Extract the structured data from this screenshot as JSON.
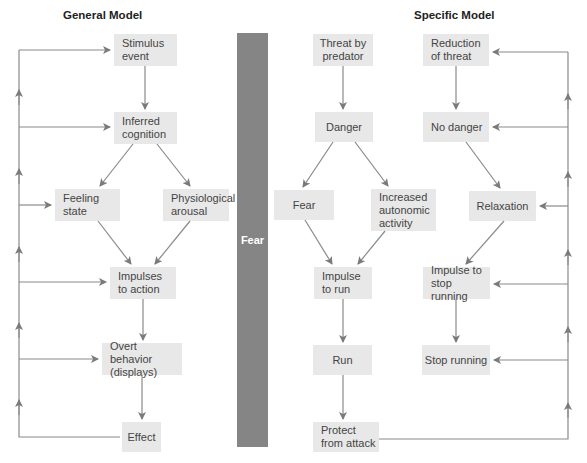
{
  "diagram": {
    "general_model": {
      "title": "General Model",
      "nodes": [
        {
          "id": "stimulus",
          "label": "Stimulus\nevent"
        },
        {
          "id": "cognition",
          "label": "Inferred\ncognition"
        },
        {
          "id": "feeling",
          "label": "Feeling\nstate"
        },
        {
          "id": "arousal",
          "label": "Physiological\narousal"
        },
        {
          "id": "impulses",
          "label": "Impulses\nto action"
        },
        {
          "id": "behavior",
          "label": "Overt behavior\n(displays)"
        },
        {
          "id": "effect",
          "label": "Effect"
        }
      ]
    },
    "center_bar": {
      "label": "Fear",
      "color": "#858585"
    },
    "specific_model": {
      "title": "Specific Model",
      "nodes": [
        {
          "id": "threat",
          "label": "Threat by\npredator"
        },
        {
          "id": "danger",
          "label": "Danger"
        },
        {
          "id": "fear",
          "label": "Fear"
        },
        {
          "id": "autonomic",
          "label": "Increased\nautonomic\nactivity"
        },
        {
          "id": "impulse_run",
          "label": "Impulse\nto run"
        },
        {
          "id": "run",
          "label": "Run"
        },
        {
          "id": "protect",
          "label": "Protect\nfrom attack"
        },
        {
          "id": "reduction",
          "label": "Reduction\nof threat"
        },
        {
          "id": "no_danger",
          "label": "No danger"
        },
        {
          "id": "relaxation",
          "label": "Relaxation"
        },
        {
          "id": "impulse_stop",
          "label": "Impulse to\nstop running"
        },
        {
          "id": "stop",
          "label": "Stop running"
        }
      ]
    },
    "colors": {
      "box_fill": "#e8e8e8",
      "arrow": "#7a7a7a",
      "bar": "#858585"
    }
  }
}
